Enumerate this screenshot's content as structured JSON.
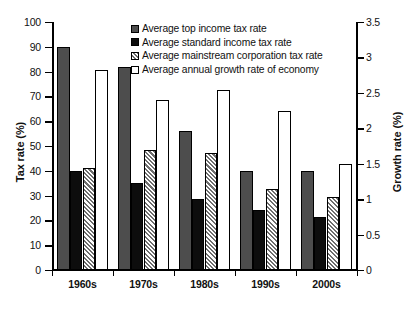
{
  "chart_data": {
    "type": "bar",
    "title": "",
    "xlabel": "",
    "ylabel": "Tax rate (%)",
    "y2label": "Growth rate (%)",
    "categories": [
      "1960s",
      "1970s",
      "1980s",
      "1990s",
      "2000s"
    ],
    "ylim": [
      0,
      100
    ],
    "y2lim": [
      0,
      3.5
    ],
    "ytick_labels": [
      "0",
      "10",
      "20",
      "30",
      "40",
      "50",
      "60",
      "70",
      "80",
      "90",
      "100"
    ],
    "ytick_values": [
      0,
      10,
      20,
      30,
      40,
      50,
      60,
      70,
      80,
      90,
      100
    ],
    "y2tick_labels": [
      "0",
      "0.5",
      "1",
      "1.5",
      "2",
      "2.5",
      "3",
      "3.5"
    ],
    "y2tick_values": [
      0,
      0.5,
      1,
      1.5,
      2,
      2.5,
      3,
      3.5
    ],
    "grid": false,
    "legend_position": "top-center-right",
    "series": [
      {
        "name": "Average top income tax rate",
        "axis": "left",
        "fill": "solid-dark-gray",
        "color": "#4d4d4d",
        "values": [
          90,
          82,
          56,
          40,
          40
        ]
      },
      {
        "name": "Average standard income tax rate",
        "axis": "left",
        "fill": "solid-black",
        "color": "#0d0d0d",
        "values": [
          40,
          35,
          28.5,
          24,
          21.5
        ]
      },
      {
        "name": "Average mainstream corporation tax rate",
        "axis": "left",
        "fill": "diagonal-hatch",
        "color": "#6e6e6e",
        "values": [
          41,
          48.5,
          47,
          32.5,
          29.5
        ]
      },
      {
        "name": "Average annual growth rate of economy",
        "axis": "right",
        "fill": "white-outline",
        "color": "#ffffff",
        "values": [
          2.82,
          2.4,
          2.54,
          2.24,
          1.5
        ]
      }
    ]
  }
}
